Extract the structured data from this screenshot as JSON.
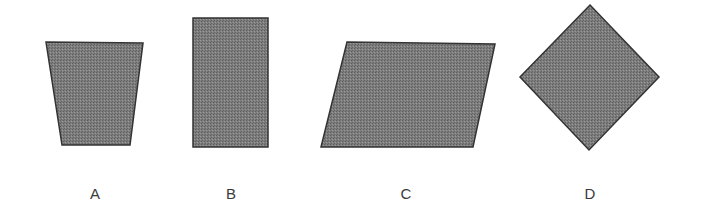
{
  "figure": {
    "fill_color": "#7a7a7a",
    "stroke_color": "#333333",
    "shapes": [
      {
        "id": "A",
        "label": "A",
        "kind": "trapezoid",
        "points": "46,42 143,43 130,145 62,145",
        "label_x": 95
      },
      {
        "id": "B",
        "label": "B",
        "kind": "rectangle",
        "points": "193,18 268,18 268,147 193,147",
        "label_x": 231
      },
      {
        "id": "C",
        "label": "C",
        "kind": "parallelogram",
        "points": "347,42 495,44 473,147 321,147",
        "label_x": 406
      },
      {
        "id": "D",
        "label": "D",
        "kind": "diamond",
        "points": "590,5 659,77 589,150 520,77",
        "label_x": 590
      }
    ]
  }
}
